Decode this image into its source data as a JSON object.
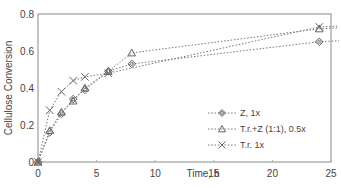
{
  "chart_data": {
    "type": "line",
    "title": "",
    "xlabel": "Time, h",
    "ylabel": "Cellulose Conversion",
    "xlim": [
      0,
      25
    ],
    "ylim": [
      0,
      0.8
    ],
    "x_ticks": [
      "0",
      "5",
      "10",
      "15",
      "20",
      "25"
    ],
    "y_ticks": [
      "0",
      "0.2",
      "0.4",
      "0.6",
      "0.8"
    ],
    "grid": false,
    "legend_position": "lower right inside",
    "series": [
      {
        "name": "Z, 1x",
        "marker": "diamond",
        "x": [
          0,
          1,
          2,
          3,
          4,
          6,
          8,
          24
        ],
        "values": [
          0,
          0.16,
          0.26,
          0.34,
          0.39,
          0.49,
          0.53,
          0.65
        ]
      },
      {
        "name": "T.r.+Z (1:1), 0.5x",
        "marker": "triangle",
        "x": [
          0,
          1,
          2,
          3,
          4,
          6,
          8,
          24
        ],
        "values": [
          0,
          0.17,
          0.27,
          0.33,
          0.4,
          0.49,
          0.59,
          0.72
        ]
      },
      {
        "name": "T.r. 1x",
        "marker": "x",
        "x": [
          0,
          1,
          2,
          3,
          4,
          6,
          24
        ],
        "values": [
          0,
          0.28,
          0.38,
          0.44,
          0.46,
          0.48,
          0.73
        ]
      }
    ]
  },
  "colors": {
    "line": "#777777",
    "marker": "#666666",
    "axis": "#888888"
  }
}
